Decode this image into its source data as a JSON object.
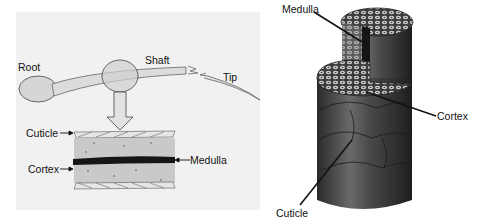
{
  "left_diagram": {
    "title": "Hair strand parts and cross-section",
    "labels": {
      "root": "Root",
      "shaft": "Shaft",
      "tip": "Tip",
      "cuticle": "Cuticle",
      "cortex": "Cortex",
      "medulla": "Medulla"
    }
  },
  "right_diagram": {
    "title": "3D hair structure",
    "labels": {
      "medulla": "Medulla",
      "cortex": "Cortex",
      "cuticle": "Cuticle"
    }
  },
  "colors": {
    "left_background": "#f1f1f1",
    "hair_fill": "#d9d9d9",
    "medulla_dark": "#151515",
    "cylinder_dark": "#3a3a3a"
  }
}
